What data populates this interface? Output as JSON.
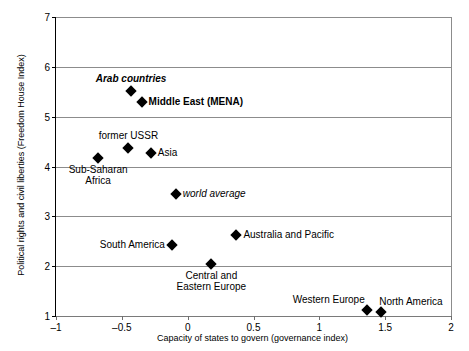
{
  "chart_data": {
    "type": "scatter",
    "title": "",
    "xlabel": "Capacity of states to govern (governance index)",
    "ylabel": "Political rights and civil liberties (Freedom House Index)",
    "xlim": [
      -1,
      2
    ],
    "ylim": [
      1,
      7
    ],
    "xticks": [
      "-1",
      "-0.5",
      "0",
      "0.5",
      "1",
      "1.5",
      "2"
    ],
    "xtick_values": [
      -1,
      -0.5,
      0,
      0.5,
      1,
      1.5,
      2
    ],
    "yticks": [
      "1",
      "2",
      "3",
      "4",
      "5",
      "6",
      "7"
    ],
    "ytick_values": [
      1,
      2,
      3,
      4,
      5,
      6,
      7
    ],
    "grid": true,
    "legend": "none",
    "points": [
      {
        "label": "Arab countries",
        "x": -0.43,
        "y": 5.52,
        "style": "bold-italic",
        "label_pos": "above"
      },
      {
        "label": "Middle East (MENA)",
        "x": -0.35,
        "y": 5.3,
        "style": "bold",
        "label_pos": "right"
      },
      {
        "label": "former USSR",
        "x": -0.45,
        "y": 4.38,
        "style": "plain",
        "label_pos": "above"
      },
      {
        "label": "Asia",
        "x": -0.28,
        "y": 4.27,
        "style": "plain",
        "label_pos": "right"
      },
      {
        "label": "Sub-Saharan\nAfrica",
        "x": -0.68,
        "y": 4.18,
        "style": "plain",
        "label_pos": "below"
      },
      {
        "label": "world average",
        "x": -0.09,
        "y": 3.45,
        "style": "italic",
        "label_pos": "right"
      },
      {
        "label": "Australia and Pacific",
        "x": 0.37,
        "y": 2.62,
        "style": "plain",
        "label_pos": "right"
      },
      {
        "label": "South America",
        "x": -0.12,
        "y": 2.42,
        "style": "plain",
        "label_pos": "left"
      },
      {
        "label": "Central and\nEastern Europe",
        "x": 0.18,
        "y": 2.05,
        "style": "plain",
        "label_pos": "below"
      },
      {
        "label": "Western Europe",
        "x": 1.36,
        "y": 1.12,
        "style": "plain",
        "label_pos": "above-left"
      },
      {
        "label": "North America",
        "x": 1.47,
        "y": 1.08,
        "style": "plain",
        "label_pos": "above-right"
      }
    ]
  },
  "colors": {
    "marker": "#000000",
    "gridline": "#8c8c8c",
    "axis": "#000000",
    "background": "#ffffff",
    "text": "#000000"
  }
}
